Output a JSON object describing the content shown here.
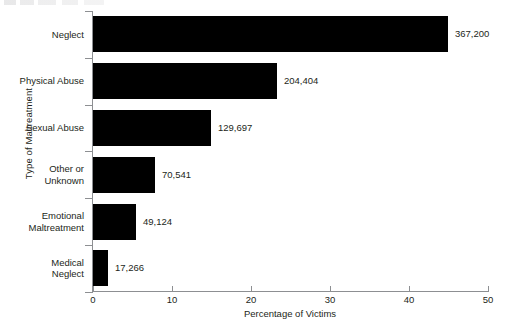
{
  "chart_data": {
    "type": "bar",
    "orientation": "horizontal",
    "title": "",
    "xlabel": "Percentage of Victims",
    "ylabel": "Type of Maltreatment",
    "categories": [
      "Neglect",
      "Physical Abuse",
      "Sexual Abuse",
      "Other or Unknown",
      "Emotional Maltreatment",
      "Medical Neglect"
    ],
    "category_lines": [
      [
        "Neglect"
      ],
      [
        "Physical Abuse"
      ],
      [
        "Sexual Abuse"
      ],
      [
        "Other or",
        "Unknown"
      ],
      [
        "Emotional",
        "Maltreatment"
      ],
      [
        "Medical",
        "Neglect"
      ]
    ],
    "values": [
      44.9,
      23.3,
      14.9,
      7.8,
      5.4,
      1.9
    ],
    "data_labels": [
      "367,200",
      "204,404",
      "129,697",
      "70,541",
      "49,124",
      "17,266"
    ],
    "counts": [
      367200,
      204404,
      129697,
      70541,
      49124,
      17266
    ],
    "xlim": [
      0,
      50
    ],
    "xticks": [
      0,
      10,
      20,
      30,
      40,
      50
    ],
    "xtick_labels": [
      "0",
      "10",
      "20",
      "30",
      "40",
      "50"
    ],
    "grid": false,
    "legend": false,
    "bar_color": "#000000",
    "axis_color": "#8d8f92",
    "text_color": "#231f20",
    "background_color": "#ffffff"
  }
}
